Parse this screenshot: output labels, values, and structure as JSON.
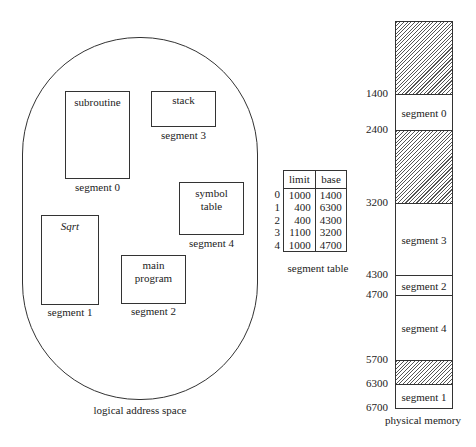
{
  "logical_space": {
    "caption": "logical address space",
    "segments": [
      {
        "content": "subroutine",
        "label": "segment 0"
      },
      {
        "content": "Sqrt",
        "label": "segment 1"
      },
      {
        "content": "main program",
        "content_lines": [
          "main",
          "program"
        ],
        "label": "segment 2"
      },
      {
        "content": "stack",
        "label": "segment 3"
      },
      {
        "content": "symbol table",
        "content_lines": [
          "symbol",
          "table"
        ],
        "label": "segment 4"
      }
    ]
  },
  "segment_table": {
    "caption": "segment table",
    "headers": [
      "limit",
      "base"
    ],
    "rows": [
      {
        "index": "0",
        "limit": "1000",
        "base": "1400"
      },
      {
        "index": "1",
        "limit": "400",
        "base": "6300"
      },
      {
        "index": "2",
        "limit": "400",
        "base": "4300"
      },
      {
        "index": "3",
        "limit": "1100",
        "base": "3200"
      },
      {
        "index": "4",
        "limit": "1000",
        "base": "4700"
      }
    ]
  },
  "physical_memory": {
    "caption": "physical memory",
    "addresses": [
      "1400",
      "2400",
      "3200",
      "4300",
      "4700",
      "5700",
      "6300",
      "6700"
    ],
    "regions": [
      {
        "label": "",
        "type": "free"
      },
      {
        "label": "segment 0",
        "type": "segment"
      },
      {
        "label": "",
        "type": "free"
      },
      {
        "label": "segment 3",
        "type": "segment"
      },
      {
        "label": "segment 2",
        "type": "segment"
      },
      {
        "label": "segment 4",
        "type": "segment"
      },
      {
        "label": "",
        "type": "free"
      },
      {
        "label": "segment 1",
        "type": "segment"
      }
    ]
  }
}
